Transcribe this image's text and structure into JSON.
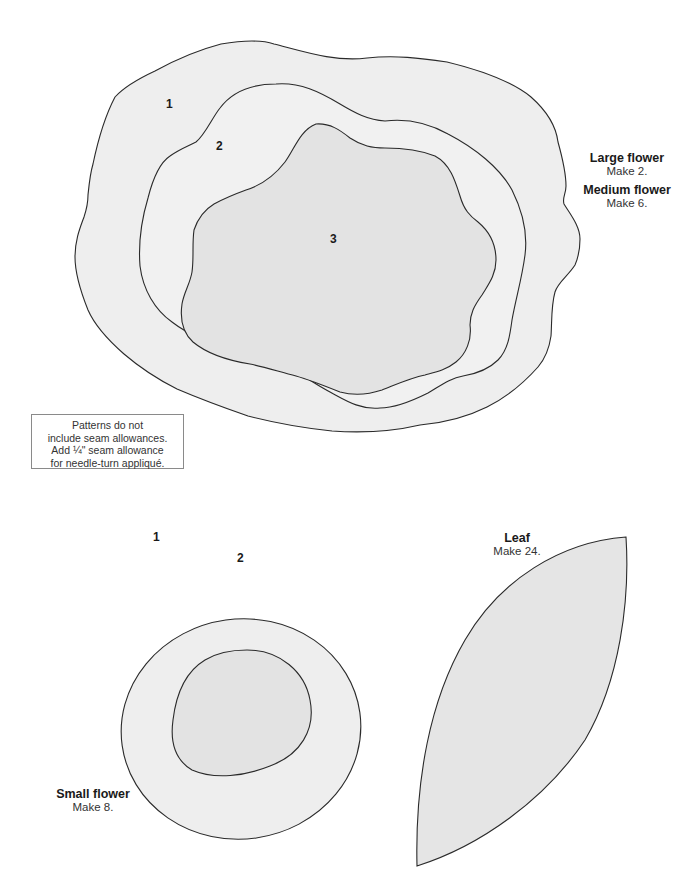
{
  "colors": {
    "outline": "#2a2a2a",
    "fill_light": "#eeeeee",
    "fill_mid": "#f1f1f1",
    "fill_dark": "#e3e3e3",
    "leaf_fill": "#e5e5e5",
    "background": "#ffffff"
  },
  "large_flower": {
    "piece_numbers": [
      "1",
      "2",
      "3"
    ],
    "labels": [
      {
        "title": "Large flower",
        "instruction": "Make 2."
      },
      {
        "title": "Medium flower",
        "instruction": "Make 6."
      }
    ]
  },
  "note": {
    "lines": [
      "Patterns do not",
      "include seam allowances.",
      "Add ¼\" seam allowance",
      "for needle-turn appliqué."
    ]
  },
  "small_flower": {
    "piece_numbers": [
      "1",
      "2"
    ],
    "label": {
      "title": "Small flower",
      "instruction": "Make 8."
    }
  },
  "leaf": {
    "label": {
      "title": "Leaf",
      "instruction": "Make 24."
    }
  }
}
